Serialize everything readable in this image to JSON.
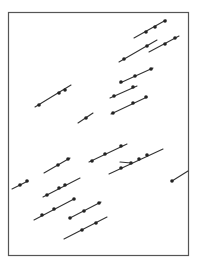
{
  "figure": {
    "frame": {
      "x": 8.5,
      "y": 12.5,
      "width": 180,
      "height": 243,
      "stroke": "#555555"
    },
    "line_color": "#333333",
    "dot_color": "#222222",
    "segments": [
      {
        "x1": 134,
        "y1": 38,
        "x2": 166,
        "y2": 20,
        "dots": [
          [
            146,
            32
          ],
          [
            155,
            27
          ],
          [
            165,
            21
          ]
        ]
      },
      {
        "x1": 119,
        "y1": 62,
        "x2": 157,
        "y2": 40,
        "dots": [
          [
            124,
            59
          ],
          [
            147,
            46
          ]
        ]
      },
      {
        "x1": 149,
        "y1": 52,
        "x2": 179,
        "y2": 36,
        "dots": [
          [
            165,
            44
          ],
          [
            175,
            38
          ]
        ]
      },
      {
        "x1": 120,
        "y1": 83,
        "x2": 153,
        "y2": 68,
        "dots": [
          [
            121,
            82
          ],
          [
            135,
            76
          ],
          [
            151,
            69
          ]
        ]
      },
      {
        "x1": 110,
        "y1": 98,
        "x2": 137,
        "y2": 86,
        "dots": [
          [
            114,
            96
          ],
          [
            133,
            87
          ]
        ]
      },
      {
        "x1": 111,
        "y1": 114,
        "x2": 147,
        "y2": 97,
        "dots": [
          [
            113,
            113
          ],
          [
            133,
            103
          ],
          [
            146,
            97
          ]
        ]
      },
      {
        "x1": 35,
        "y1": 107,
        "x2": 71,
        "y2": 85,
        "dots": [
          [
            39,
            105
          ],
          [
            59,
            93
          ],
          [
            65,
            90
          ]
        ]
      },
      {
        "x1": 78,
        "y1": 123,
        "x2": 93,
        "y2": 113,
        "dots": [
          [
            86,
            118
          ]
        ]
      },
      {
        "x1": 44,
        "y1": 173,
        "x2": 70,
        "y2": 158,
        "dots": [
          [
            58,
            165
          ],
          [
            68,
            159
          ]
        ]
      },
      {
        "x1": 12,
        "y1": 189,
        "x2": 28,
        "y2": 181,
        "dots": [
          [
            20,
            185
          ],
          [
            27,
            181
          ]
        ]
      },
      {
        "x1": 43,
        "y1": 197,
        "x2": 80,
        "y2": 178,
        "dots": [
          [
            47,
            195
          ],
          [
            59,
            188
          ],
          [
            65,
            185
          ]
        ]
      },
      {
        "x1": 89,
        "y1": 162,
        "x2": 127,
        "y2": 144,
        "dots": [
          [
            92,
            161
          ],
          [
            105,
            154
          ],
          [
            121,
            146
          ]
        ]
      },
      {
        "x1": 109,
        "y1": 174,
        "x2": 163,
        "y2": 149,
        "dots": [
          [
            121,
            168
          ],
          [
            131,
            163
          ],
          [
            139,
            159
          ],
          [
            147,
            155
          ]
        ]
      },
      {
        "x1": 120,
        "y1": 162,
        "x2": 131,
        "y2": 163,
        "dots": []
      },
      {
        "x1": 172,
        "y1": 181,
        "x2": 188,
        "y2": 171,
        "dots": [
          [
            172,
            181
          ]
        ]
      },
      {
        "x1": 34,
        "y1": 220,
        "x2": 74,
        "y2": 199,
        "dots": [
          [
            42,
            215
          ],
          [
            54,
            209
          ],
          [
            74,
            199
          ]
        ]
      },
      {
        "x1": 70,
        "y1": 218,
        "x2": 101,
        "y2": 202,
        "dots": [
          [
            70,
            218
          ],
          [
            84,
            211
          ],
          [
            99,
            203
          ]
        ]
      },
      {
        "x1": 64,
        "y1": 239,
        "x2": 107,
        "y2": 217,
        "dots": [
          [
            82,
            230
          ],
          [
            96,
            223
          ]
        ]
      }
    ]
  }
}
